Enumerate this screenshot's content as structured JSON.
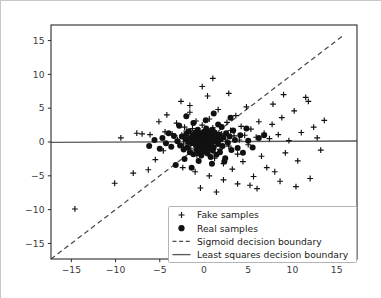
{
  "chart_data": {
    "type": "scatter",
    "title": "",
    "xlabel": "",
    "ylabel": "",
    "xlim": [
      -17.3,
      17.3
    ],
    "ylim": [
      -17.3,
      17.3
    ],
    "grid": false,
    "legend_position": "lower right",
    "xticks": [
      "-15",
      "-10",
      "-5",
      "0",
      "5",
      "10",
      "15"
    ],
    "xtick_values": [
      -15,
      -10,
      -5,
      0,
      5,
      10,
      15
    ],
    "yticks": [
      "15",
      "10",
      "5",
      "0",
      "-5",
      "-10",
      "-15"
    ],
    "ytick_values": [
      15,
      10,
      5,
      0,
      -5,
      -10,
      -15
    ],
    "legend": [
      {
        "label": "Fake samples",
        "marker": "plus",
        "style": "marker"
      },
      {
        "label": "Real samples",
        "marker": "circle",
        "style": "marker"
      },
      {
        "label": "Sigmoid decision boundary",
        "marker": "dashed-line",
        "style": "line"
      },
      {
        "label": "Least squares decision boundary",
        "marker": "solid-line",
        "style": "line"
      }
    ],
    "series": [
      {
        "name": "Fake samples",
        "marker": "plus",
        "color": "#111111",
        "points": [
          [
            -14.6,
            -9.9
          ],
          [
            -10.1,
            -6.1
          ],
          [
            -8.0,
            -4.6
          ],
          [
            -6.3,
            -4.1
          ],
          [
            -5.5,
            -2.6
          ],
          [
            -4.6,
            -1.3
          ],
          [
            -9.4,
            0.6
          ],
          [
            -7.6,
            1.3
          ],
          [
            -7.0,
            1.2
          ],
          [
            -6.1,
            1.1
          ],
          [
            -5.1,
            3.0
          ],
          [
            -4.4,
            1.5
          ],
          [
            -3.6,
            1.2
          ],
          [
            -3.3,
            0.9
          ],
          [
            -3.1,
            2.8
          ],
          [
            -3.0,
            0.3
          ],
          [
            -2.6,
            6.0
          ],
          [
            -2.5,
            1.0
          ],
          [
            -2.3,
            -0.3
          ],
          [
            -2.2,
            2.2
          ],
          [
            -2.0,
            1.6
          ],
          [
            -1.8,
            0.7
          ],
          [
            -1.6,
            4.4
          ],
          [
            -1.5,
            -1.0
          ],
          [
            -1.3,
            2.0
          ],
          [
            -1.1,
            0.2
          ],
          [
            -0.9,
            3.1
          ],
          [
            -0.8,
            -2.0
          ],
          [
            -0.6,
            1.4
          ],
          [
            -0.4,
            0.5
          ],
          [
            -0.2,
            2.5
          ],
          [
            0.0,
            -1.5
          ],
          [
            0.2,
            1.8
          ],
          [
            0.4,
            0.2
          ],
          [
            0.6,
            3.4
          ],
          [
            0.8,
            -0.8
          ],
          [
            1.0,
            2.1
          ],
          [
            1.2,
            -2.4
          ],
          [
            1.4,
            0.6
          ],
          [
            1.6,
            4.8
          ],
          [
            1.8,
            -1.1
          ],
          [
            2.0,
            1.2
          ],
          [
            2.2,
            -3.2
          ],
          [
            2.4,
            0.4
          ],
          [
            2.6,
            2.9
          ],
          [
            2.8,
            -0.6
          ],
          [
            3.0,
            1.7
          ],
          [
            3.2,
            -4.0
          ],
          [
            3.4,
            0.9
          ],
          [
            3.6,
            3.9
          ],
          [
            3.8,
            -1.8
          ],
          [
            4.0,
            0.3
          ],
          [
            4.2,
            2.3
          ],
          [
            4.4,
            -2.9
          ],
          [
            4.6,
            1.0
          ],
          [
            4.8,
            5.2
          ],
          [
            5.0,
            -0.4
          ],
          [
            5.3,
            1.9
          ],
          [
            5.6,
            -5.1
          ],
          [
            5.9,
            0.7
          ],
          [
            6.2,
            3.0
          ],
          [
            6.5,
            -2.1
          ],
          [
            6.8,
            1.3
          ],
          [
            7.1,
            -3.8
          ],
          [
            7.4,
            0.5
          ],
          [
            7.7,
            2.6
          ],
          [
            8.0,
            -4.4
          ],
          [
            8.4,
            1.1
          ],
          [
            8.8,
            3.6
          ],
          [
            9.2,
            -1.6
          ],
          [
            9.6,
            0.2
          ],
          [
            10.2,
            4.6
          ],
          [
            10.6,
            -2.8
          ],
          [
            11.0,
            1.4
          ],
          [
            11.5,
            6.6
          ],
          [
            11.8,
            6.0
          ],
          [
            12.0,
            -5.4
          ],
          [
            12.4,
            2.2
          ],
          [
            12.8,
            0.6
          ],
          [
            13.2,
            -1.2
          ],
          [
            13.6,
            3.2
          ],
          [
            5.2,
            -6.4
          ],
          [
            6.0,
            -6.9
          ],
          [
            3.8,
            -6.2
          ],
          [
            2.2,
            -5.6
          ],
          [
            0.6,
            -5.0
          ],
          [
            -1.0,
            -4.4
          ],
          [
            -2.4,
            -3.8
          ],
          [
            -0.4,
            -6.8
          ],
          [
            1.4,
            -7.4
          ],
          [
            -1.6,
            5.4
          ],
          [
            -4.2,
            4.0
          ],
          [
            9.0,
            7.0
          ],
          [
            7.8,
            5.6
          ],
          [
            2.8,
            7.2
          ],
          [
            0.4,
            6.8
          ],
          [
            -0.2,
            8.2
          ],
          [
            1.0,
            9.4
          ],
          [
            10.4,
            -6.6
          ],
          [
            8.6,
            -5.8
          ]
        ]
      },
      {
        "name": "Real samples",
        "marker": "circle",
        "color": "#111111",
        "points": [
          [
            -3.0,
            0.1
          ],
          [
            -2.7,
            -0.5
          ],
          [
            -2.5,
            0.8
          ],
          [
            -2.3,
            -1.1
          ],
          [
            -2.1,
            0.4
          ],
          [
            -2.0,
            1.2
          ],
          [
            -1.9,
            -0.8
          ],
          [
            -1.8,
            0.0
          ],
          [
            -1.7,
            1.6
          ],
          [
            -1.6,
            -1.5
          ],
          [
            -1.5,
            0.6
          ],
          [
            -1.4,
            -0.2
          ],
          [
            -1.3,
            1.0
          ],
          [
            -1.2,
            -1.8
          ],
          [
            -1.1,
            0.3
          ],
          [
            -1.0,
            1.4
          ],
          [
            -0.9,
            -0.6
          ],
          [
            -0.85,
            0.9
          ],
          [
            -0.8,
            -1.2
          ],
          [
            -0.75,
            0.2
          ],
          [
            -0.7,
            1.8
          ],
          [
            -0.65,
            -0.4
          ],
          [
            -0.6,
            0.7
          ],
          [
            -0.55,
            -1.6
          ],
          [
            -0.5,
            0.1
          ],
          [
            -0.45,
            1.1
          ],
          [
            -0.4,
            -0.9
          ],
          [
            -0.35,
            0.5
          ],
          [
            -0.3,
            -2.0
          ],
          [
            -0.25,
            1.3
          ],
          [
            -0.2,
            -0.3
          ],
          [
            -0.15,
            0.8
          ],
          [
            -0.1,
            -1.4
          ],
          [
            -0.05,
            0.2
          ],
          [
            0.0,
            1.5
          ],
          [
            0.05,
            -0.7
          ],
          [
            0.1,
            0.9
          ],
          [
            0.15,
            -1.1
          ],
          [
            0.2,
            0.4
          ],
          [
            0.25,
            2.0
          ],
          [
            0.3,
            -0.5
          ],
          [
            0.35,
            1.2
          ],
          [
            0.4,
            -1.7
          ],
          [
            0.45,
            0.3
          ],
          [
            0.5,
            0.8
          ],
          [
            0.55,
            -0.2
          ],
          [
            0.6,
            1.6
          ],
          [
            0.65,
            -1.0
          ],
          [
            0.7,
            0.5
          ],
          [
            0.75,
            -2.2
          ],
          [
            0.8,
            1.0
          ],
          [
            0.85,
            -0.4
          ],
          [
            0.9,
            0.2
          ],
          [
            0.95,
            1.8
          ],
          [
            1.0,
            -1.3
          ],
          [
            1.05,
            0.6
          ],
          [
            1.1,
            -0.8
          ],
          [
            1.2,
            1.4
          ],
          [
            1.3,
            0.1
          ],
          [
            1.4,
            -1.9
          ],
          [
            1.5,
            0.9
          ],
          [
            1.6,
            -0.3
          ],
          [
            1.7,
            1.1
          ],
          [
            1.8,
            -1.5
          ],
          [
            1.9,
            0.4
          ],
          [
            2.0,
            2.2
          ],
          [
            2.1,
            -0.6
          ],
          [
            2.2,
            0.7
          ],
          [
            2.4,
            -2.4
          ],
          [
            2.5,
            1.3
          ],
          [
            2.7,
            -0.1
          ],
          [
            2.9,
            0.8
          ],
          [
            3.1,
            -1.2
          ],
          [
            3.3,
            1.7
          ],
          [
            3.5,
            0.3
          ],
          [
            3.8,
            -0.9
          ],
          [
            4.1,
            1.0
          ],
          [
            4.4,
            -1.6
          ],
          [
            -3.4,
            0.9
          ],
          [
            -3.7,
            -0.7
          ],
          [
            -4.0,
            1.3
          ],
          [
            -4.3,
            -0.2
          ],
          [
            -4.7,
            0.6
          ],
          [
            -5.0,
            -1.0
          ],
          [
            -2.8,
            2.4
          ],
          [
            -1.2,
            2.8
          ],
          [
            0.2,
            3.2
          ],
          [
            1.6,
            2.6
          ],
          [
            -0.6,
            -2.8
          ],
          [
            0.9,
            -3.2
          ],
          [
            2.3,
            -2.9
          ],
          [
            -2.2,
            -2.5
          ],
          [
            5.0,
            0.2
          ],
          [
            5.5,
            -0.8
          ],
          [
            6.2,
            0.6
          ],
          [
            -5.6,
            0.3
          ],
          [
            3.0,
            3.6
          ],
          [
            -2.0,
            3.8
          ],
          [
            4.8,
            2.0
          ],
          [
            -3.2,
            -3.4
          ],
          [
            1.1,
            4.2
          ],
          [
            -1.4,
            -3.8
          ],
          [
            6.8,
            1.0
          ],
          [
            -6.2,
            -0.6
          ]
        ]
      }
    ],
    "lines": [
      {
        "name": "Sigmoid decision boundary",
        "style": "dashed",
        "color": "#4a4a4a",
        "endpoints": [
          [
            -17.3,
            -17.3
          ],
          [
            15.6,
            15.6
          ]
        ]
      },
      {
        "name": "Least squares decision boundary",
        "style": "solid",
        "color": "#5a5a5a",
        "endpoints": [
          [
            -17.3,
            -0.05
          ],
          [
            17.3,
            0.15
          ]
        ]
      }
    ]
  },
  "figure": {
    "background": "#ffffff",
    "frame_color": "#2b2b2b",
    "border_color": "#c8c8c8"
  }
}
